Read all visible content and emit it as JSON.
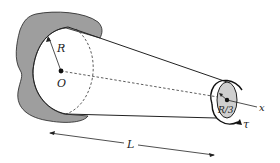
{
  "diagram": {
    "type": "tapered-shaft-torsion",
    "labels": {
      "radius_large": "R",
      "origin": "O",
      "radius_small": "R/3",
      "axis": "x",
      "torque": "τ",
      "length": "L"
    },
    "colors": {
      "wall_fill": "#9e9e9e",
      "end_face_fill": "#cfcfcf",
      "stroke": "#222222",
      "background": "#ffffff"
    }
  }
}
